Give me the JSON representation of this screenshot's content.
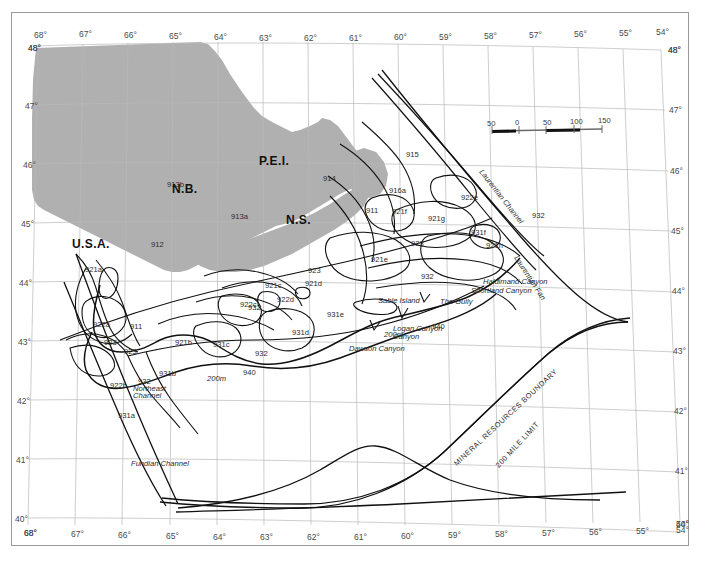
{
  "map": {
    "title": "Scotian Shelf and Bay of Fundy Fishing Areas",
    "region": "Maritimes - Northwest Atlantic",
    "background_color": "#ffffff",
    "land_color": "#b0b0b0",
    "graticule_color": "#b9b9b9",
    "line_color": "#1a1a1a",
    "frame_color": "#9a9a9a"
  },
  "axes": {
    "longitude_top": [
      "68°",
      "67°",
      "66°",
      "65°",
      "64°",
      "63°",
      "62°",
      "61°",
      "60°",
      "59°",
      "58°",
      "57°",
      "56°",
      "55°",
      "54°"
    ],
    "longitude_bottom": [
      "68°",
      "67°",
      "66°",
      "65°",
      "64°",
      "63°",
      "62°",
      "61°",
      "60°",
      "59°",
      "58°",
      "57°",
      "56°",
      "55°",
      "54°"
    ],
    "latitude_left": [
      "48°",
      "47°",
      "46°",
      "45°",
      "44°",
      "43°",
      "42°",
      "41°",
      "40°"
    ],
    "latitude_right": [
      "48°",
      "47°",
      "46°",
      "45°",
      "44°",
      "43°",
      "42°",
      "41°",
      "40°"
    ],
    "corner_top_left": "48°",
    "corner_top_right": "48°",
    "corner_bottom_left": "68°",
    "corner_bottom_right": "54°"
  },
  "scalebar": {
    "labels": [
      "50",
      "0",
      "50",
      "100",
      "150"
    ],
    "units": "km"
  },
  "provinces": [
    {
      "name": "N.B.",
      "x": 172,
      "y": 182
    },
    {
      "name": "P.E.I.",
      "x": 259,
      "y": 154
    },
    {
      "name": "N.S.",
      "x": 286,
      "y": 213
    },
    {
      "name": "U.S.A.",
      "x": 72,
      "y": 237
    }
  ],
  "zones": [
    {
      "code": "913b",
      "x": 167,
      "y": 180
    },
    {
      "code": "913a",
      "x": 231,
      "y": 212
    },
    {
      "code": "912",
      "x": 151,
      "y": 240
    },
    {
      "code": "914",
      "x": 323,
      "y": 174
    },
    {
      "code": "915",
      "x": 406,
      "y": 150
    },
    {
      "code": "916a",
      "x": 389,
      "y": 186
    },
    {
      "code": "911",
      "x": 366,
      "y": 206
    },
    {
      "code": "921f",
      "x": 392,
      "y": 207
    },
    {
      "code": "921g",
      "x": 428,
      "y": 214
    },
    {
      "code": "922e",
      "x": 461,
      "y": 193
    },
    {
      "code": "921h",
      "x": 486,
      "y": 241
    },
    {
      "code": "932",
      "x": 532,
      "y": 211
    },
    {
      "code": "923",
      "x": 411,
      "y": 239
    },
    {
      "code": "921e",
      "x": 371,
      "y": 255
    },
    {
      "code": "932",
      "x": 421,
      "y": 272
    },
    {
      "code": "931f",
      "x": 471,
      "y": 228
    },
    {
      "code": "921a",
      "x": 85,
      "y": 265
    },
    {
      "code": "922a",
      "x": 93,
      "y": 320
    },
    {
      "code": "923",
      "x": 104,
      "y": 338
    },
    {
      "code": "911",
      "x": 130,
      "y": 322
    },
    {
      "code": "921b",
      "x": 175,
      "y": 338
    },
    {
      "code": "921c",
      "x": 265,
      "y": 281
    },
    {
      "code": "921d",
      "x": 305,
      "y": 279
    },
    {
      "code": "922d",
      "x": 277,
      "y": 295
    },
    {
      "code": "922c",
      "x": 240,
      "y": 300
    },
    {
      "code": "923",
      "x": 308,
      "y": 266
    },
    {
      "code": "931c",
      "x": 213,
      "y": 340
    },
    {
      "code": "931d",
      "x": 292,
      "y": 328
    },
    {
      "code": "931e",
      "x": 327,
      "y": 310
    },
    {
      "code": "932",
      "x": 255,
      "y": 349
    },
    {
      "code": "932",
      "x": 248,
      "y": 303
    },
    {
      "code": "931b",
      "x": 159,
      "y": 369
    },
    {
      "code": "922b",
      "x": 110,
      "y": 381
    },
    {
      "code": "932",
      "x": 138,
      "y": 377
    },
    {
      "code": "931a",
      "x": 118,
      "y": 411
    },
    {
      "code": "940",
      "x": 243,
      "y": 368
    },
    {
      "code": "940",
      "x": 432,
      "y": 322
    },
    {
      "code": "923",
      "x": 124,
      "y": 347
    }
  ],
  "features": [
    {
      "name": "Laurentian Channel",
      "x": 481,
      "y": 166,
      "rotate": 52,
      "style": "italic"
    },
    {
      "name": "Laurentian Fan",
      "x": 516,
      "y": 252,
      "rotate": 57,
      "style": "italic"
    },
    {
      "name": "Haldimand Canyon",
      "x": 483,
      "y": 277,
      "rotate": 0,
      "style": "italic"
    },
    {
      "name": "Shortland Canyon",
      "x": 471,
      "y": 286,
      "rotate": 0,
      "style": "italic"
    },
    {
      "name": "Sable Island",
      "x": 378,
      "y": 296,
      "rotate": 0,
      "style": "italic"
    },
    {
      "name": "The Gully",
      "x": 440,
      "y": 297,
      "rotate": 0,
      "style": "italic"
    },
    {
      "name": "Logan Canyon",
      "x": 393,
      "y": 324,
      "rotate": 0,
      "style": "italic"
    },
    {
      "name": "Canyon",
      "x": 393,
      "y": 332,
      "rotate": 0,
      "style": "italic"
    },
    {
      "name": "Dawson Canyon",
      "x": 349,
      "y": 344,
      "rotate": 0,
      "style": "italic"
    },
    {
      "name": "Northeast",
      "x": 133,
      "y": 384,
      "rotate": 0,
      "style": "italic"
    },
    {
      "name": "Channel",
      "x": 133,
      "y": 391,
      "rotate": 0,
      "style": "italic"
    },
    {
      "name": "Fundian Channel",
      "x": 131,
      "y": 459,
      "rotate": 0,
      "style": "italic"
    },
    {
      "name": "200m",
      "x": 207,
      "y": 374,
      "rotate": 0,
      "style": "italic"
    },
    {
      "name": "200m",
      "x": 384,
      "y": 330,
      "rotate": 0,
      "style": "italic"
    },
    {
      "name": "MINERAL RESOURCES BOUNDARY",
      "x": 455,
      "y": 460,
      "rotate": -43,
      "style": "upper"
    },
    {
      "name": "200 MILE LIMIT",
      "x": 497,
      "y": 462,
      "rotate": -47,
      "style": "upper"
    }
  ]
}
